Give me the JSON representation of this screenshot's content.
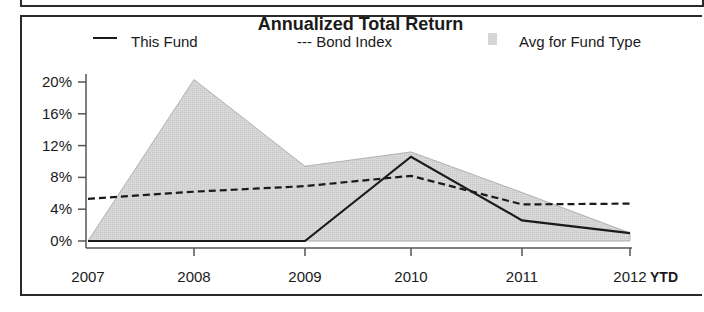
{
  "chart_data": {
    "type": "line",
    "title": "Annualized Total Return",
    "xlabel": "",
    "ylabel": "",
    "categories": [
      "2007",
      "2008",
      "2009",
      "2010",
      "2011",
      "2012 YTD"
    ],
    "x_tick_labels": [
      "2007",
      "2008",
      "2009",
      "2010",
      "2011",
      "2012"
    ],
    "x_trailing_label": "YTD",
    "y_tick_labels": [
      "20%",
      "16%",
      "12%",
      "8%",
      "4%",
      "0%"
    ],
    "ylim": [
      0,
      20
    ],
    "grid": false,
    "legend_position": "top",
    "series": [
      {
        "name": "This Fund",
        "style": "solid-line",
        "values": [
          0.0,
          0.0,
          0.0,
          10.6,
          2.6,
          1.0
        ]
      },
      {
        "name": "Bond Index",
        "style": "dashed-line",
        "values": [
          5.3,
          6.2,
          6.9,
          8.2,
          4.6,
          4.7
        ]
      },
      {
        "name": "Avg for Fund Type",
        "style": "shaded-area",
        "values": [
          0.0,
          20.3,
          9.4,
          11.2,
          6.1,
          1.0
        ]
      }
    ]
  },
  "legend": {
    "this_fund": "This Fund",
    "bond_index": "--- Bond Index",
    "avg": "Avg for Fund Type"
  },
  "colors": {
    "area_fill": "#d6d6d6",
    "line": "#1a1a1a"
  }
}
